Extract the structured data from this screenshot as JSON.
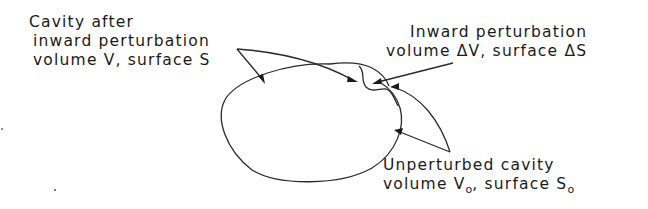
{
  "figure": {
    "type": "cavity-perturbation-diagram",
    "labels": {
      "cavity_after": {
        "line1": "Cavity after",
        "line2": "inward perturbation",
        "line3_prefix": "volume V, surface S"
      },
      "inward_perturbation": {
        "line1": "Inward perturbation",
        "line2": "volume ΔV, surface ΔS"
      },
      "unperturbed": {
        "line1": "Unperturbed cavity",
        "line2_volume": "volume V",
        "line2_volume_sub": "o",
        "line2_sep": ", surface S",
        "line2_surface_sub": "o"
      }
    },
    "colors": {
      "background": "#ffffff",
      "ink": "#1a1a1a"
    }
  }
}
